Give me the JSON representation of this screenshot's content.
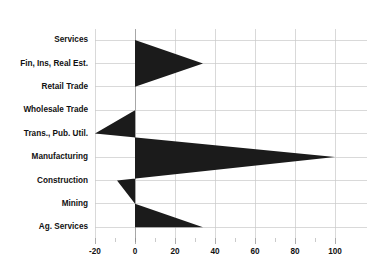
{
  "chart_data": {
    "type": "bar",
    "title": "",
    "subtitle": "",
    "xlabel": "",
    "ylabel": "",
    "orientation": "horizontal",
    "categories": [
      "Services",
      "Fin, Ins, Real Est.",
      "Retail Trade",
      "Wholesale Trade",
      "Trans., Pub. Util.",
      "Manufacturing",
      "Construction",
      "Mining",
      "Ag. Services"
    ],
    "values": [
      0,
      34,
      0,
      0,
      -20,
      100,
      -9,
      0,
      34
    ],
    "series": [
      {
        "name": "Value",
        "values": [
          0,
          34,
          0,
          0,
          -20,
          100,
          -9,
          0,
          34
        ]
      }
    ],
    "xlim": [
      -20,
      100
    ],
    "ylim": [
      0,
      8
    ],
    "xticks": [
      -20,
      0,
      20,
      40,
      60,
      80,
      100
    ],
    "xtick_labels": [
      "-20",
      "0",
      "20",
      "40",
      "60",
      "80",
      "100"
    ],
    "xminorticks": [
      -10,
      10,
      30,
      50,
      70,
      90
    ],
    "grid": true,
    "grid_axis": "both",
    "legend": false,
    "legend_position": "none",
    "fill_color": "#1b1b1b",
    "grid_color": "#c9c9c9",
    "axis_text_color": "#111111",
    "background_color": "#ffffff",
    "zero_reference": 0,
    "annotations": []
  },
  "layout": {
    "plot_left_px": 95,
    "plot_right_px": 335,
    "plot_top_px": 29,
    "plot_bottom_px": 238,
    "zero_x_px": 135,
    "px_per_unit": 2,
    "category_row_y_px": [
      40,
      63.4,
      86.8,
      110.2,
      133.6,
      157,
      180.4,
      203.8,
      227.2
    ]
  }
}
